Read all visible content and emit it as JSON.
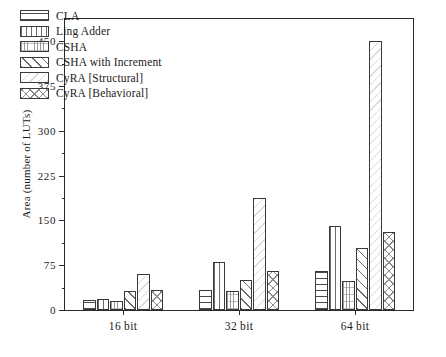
{
  "chart_data": {
    "type": "bar",
    "title": "",
    "xlabel": "",
    "ylabel": "Area (number of LUTs)",
    "categories": [
      "16 bit",
      "32 bit",
      "64 bit"
    ],
    "series": [
      {
        "name": "CLA",
        "pattern": "horizontal-lines",
        "values": [
          17,
          33,
          65
        ]
      },
      {
        "name": "Ling Adder",
        "pattern": "vertical-lines",
        "values": [
          18,
          80,
          140
        ]
      },
      {
        "name": "CSHA",
        "pattern": "fine-grid",
        "values": [
          15,
          32,
          48
        ]
      },
      {
        "name": "CSHA with Increment",
        "pattern": "diagonal-lines",
        "values": [
          31,
          50,
          103
        ]
      },
      {
        "name": "CyRA [Structural]",
        "pattern": "faint-diagonal",
        "values": [
          60,
          188,
          450
        ]
      },
      {
        "name": "CyRA [Behavioral]",
        "pattern": "crosshatch",
        "values": [
          33,
          66,
          130
        ]
      }
    ],
    "ylim": [
      0,
      487
    ],
    "yticks": [
      0,
      75,
      150,
      225,
      300,
      375,
      450
    ],
    "ytick_labels": [
      "0",
      "75",
      "150",
      "225",
      "300",
      "375",
      "450"
    ],
    "yminor_step": 37.5,
    "grid": false,
    "legend_position": "upper-left"
  },
  "legend": {
    "items": [
      {
        "label": "CLA"
      },
      {
        "label": "Ling Adder"
      },
      {
        "label": "CSHA"
      },
      {
        "label": "CSHA with Increment"
      },
      {
        "label": "CyRA [Structural]"
      },
      {
        "label": "CyRA [Behavioral]"
      }
    ]
  },
  "axes": {
    "y_title": "Area (number of LUTs)",
    "y_labels": [
      "0",
      "75",
      "150",
      "225",
      "300",
      "375",
      "450"
    ],
    "x_labels": [
      "16 bit",
      "32 bit",
      "64 bit"
    ]
  },
  "colors": {
    "frame": "#2b2b2b",
    "bar_outline": "#3a3a3a",
    "background": "#ffffff",
    "text": "#1a1a1a"
  }
}
